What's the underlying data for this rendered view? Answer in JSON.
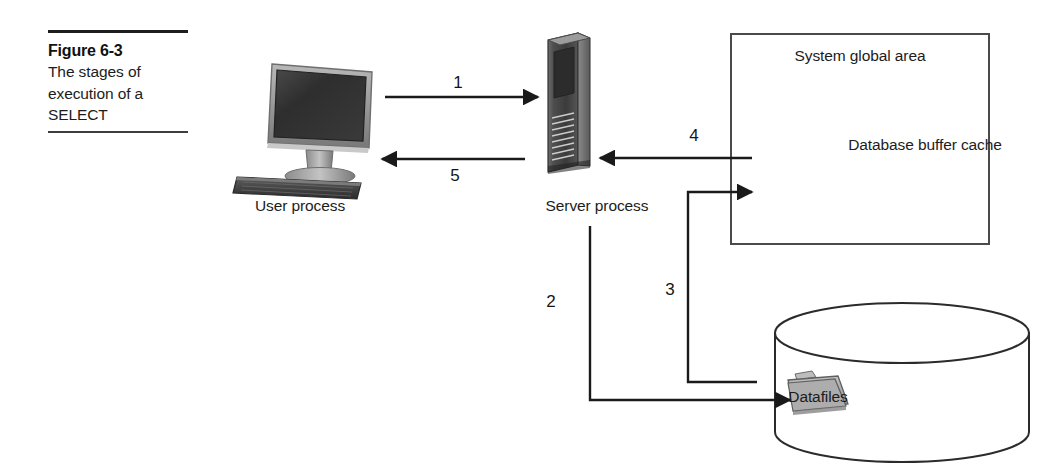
{
  "figure": {
    "caption_title": "Figure 6-3",
    "caption_text": "The stages of execution of a SELECT"
  },
  "nodes": {
    "user_process": {
      "label": "User process",
      "icon": "desktop-monitor-icon"
    },
    "server_process": {
      "label": "Server process",
      "icon": "server-tower-icon"
    },
    "sga": {
      "label": "System global area"
    },
    "buffer_cache": {
      "label": "Database buffer cache",
      "icon": "stacked-disk-cylinder-icon"
    },
    "datafiles": {
      "label": "Datafiles",
      "icon": "folder-icon",
      "container_icon": "disk-cylinder-icon"
    }
  },
  "steps": [
    {
      "id": "1",
      "label": "1",
      "from": "user_process",
      "to": "server_process",
      "direction": "right"
    },
    {
      "id": "2",
      "label": "2",
      "from": "server_process",
      "to": "datafiles",
      "direction": "down-right"
    },
    {
      "id": "3",
      "label": "3",
      "from": "datafiles",
      "to": "buffer_cache",
      "direction": "up-right"
    },
    {
      "id": "4",
      "label": "4",
      "from": "buffer_cache",
      "to": "server_process",
      "direction": "left"
    },
    {
      "id": "5",
      "label": "5",
      "from": "server_process",
      "to": "user_process",
      "direction": "left"
    }
  ],
  "colors": {
    "line": "#1a1a1a",
    "box_border": "#4a4a4a",
    "text": "#1c1c1c",
    "cylinder_light": "#e8e8e8",
    "cylinder_dark": "#8f8f8f",
    "folder": "#a8a8a8",
    "background": "#ffffff"
  }
}
